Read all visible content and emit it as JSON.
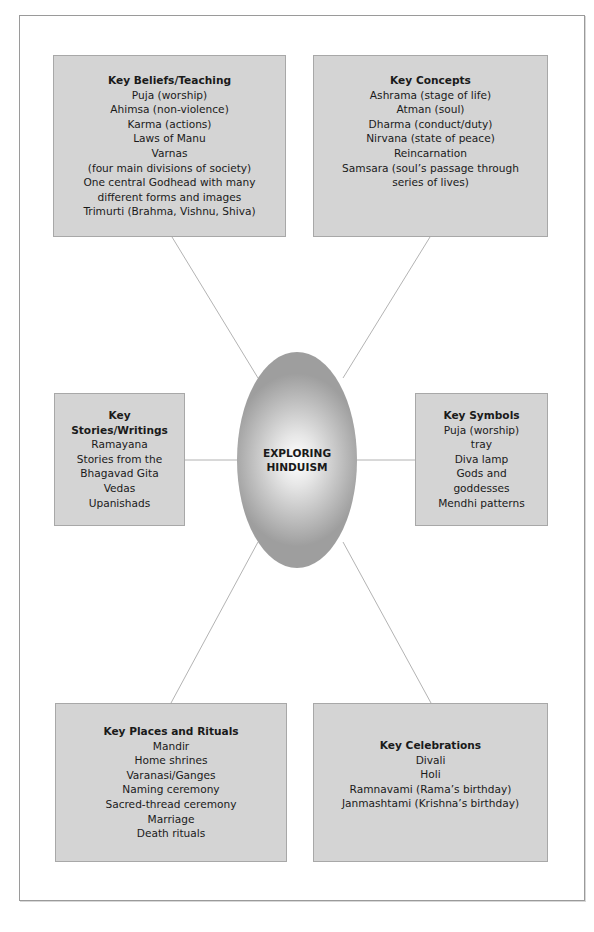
{
  "diagram": {
    "center": {
      "line1": "EXPLORING",
      "line2": "HINDUISM"
    },
    "nodes": {
      "key_beliefs": {
        "title": "Key Beliefs/Teaching",
        "items": [
          "Puja (worship)",
          "Ahimsa (non-violence)",
          "Karma (actions)",
          "Laws of Manu",
          "Varnas",
          "(four main divisions of society)",
          "One central Godhead with many",
          "different forms and images",
          "Trimurti (Brahma, Vishnu, Shiva)"
        ]
      },
      "key_concepts": {
        "title": "Key Concepts",
        "items": [
          "Ashrama (stage of life)",
          "Atman (soul)",
          "Dharma (conduct/duty)",
          "Nirvana (state of peace)",
          "Reincarnation",
          "Samsara (soul’s passage through",
          "series of lives)"
        ]
      },
      "key_stories": {
        "title_line1": "Key",
        "title_line2": "Stories/Writings",
        "items": [
          "Ramayana",
          "Stories from the",
          "Bhagavad Gita",
          "Vedas",
          "Upanishads"
        ]
      },
      "key_symbols": {
        "title": "Key Symbols",
        "items": [
          "Puja (worship)",
          "tray",
          "Diva lamp",
          "Gods and",
          "goddesses",
          "Mendhi patterns"
        ]
      },
      "key_places": {
        "title": "Key Places and Rituals",
        "items": [
          "Mandir",
          "Home shrines",
          "Varanasi/Ganges",
          "Naming ceremony",
          "Sacred-thread ceremony",
          "Marriage",
          "Death rituals"
        ]
      },
      "key_celebrations": {
        "title": "Key Celebrations",
        "items": [
          "Divali",
          "Holi",
          "Ramnavami (Rama’s birthday)",
          "Janmashtami (Krishna’s birthday)"
        ]
      }
    },
    "colors": {
      "box_fill": "#d4d4d4",
      "box_border": "#a8a8a8",
      "connector": "#a0a0a0",
      "frame_border": "#9a9a9a"
    }
  }
}
